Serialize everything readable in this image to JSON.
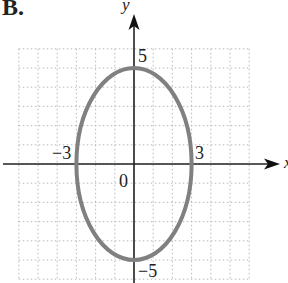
{
  "figure": {
    "label": "B.",
    "x_axis_label": "x",
    "y_axis_label": "y",
    "tick_labels": {
      "x_neg": "−3",
      "x_pos": "3",
      "y_pos": "5",
      "y_neg": "−5",
      "origin": "0"
    },
    "colors": {
      "curve": "#808080",
      "axes": "#222222",
      "grid": "#b0b0b0"
    }
  },
  "chart_data": {
    "type": "line",
    "title": "B.",
    "xlabel": "x",
    "ylabel": "y",
    "curve": {
      "shape": "ellipse",
      "center": [
        0,
        0
      ],
      "semi_axis_x": 3,
      "semi_axis_y": 5
    },
    "labeled_points": [
      {
        "x": -3,
        "y": 0,
        "label": "−3"
      },
      {
        "x": 3,
        "y": 0,
        "label": "3"
      },
      {
        "x": 0,
        "y": 5,
        "label": "5"
      },
      {
        "x": 0,
        "y": -5,
        "label": "−5"
      },
      {
        "x": 0,
        "y": 0,
        "label": "0"
      }
    ],
    "xlim": [
      -6,
      6
    ],
    "ylim": [
      -6,
      6
    ],
    "grid": true,
    "grid_step": 1
  }
}
